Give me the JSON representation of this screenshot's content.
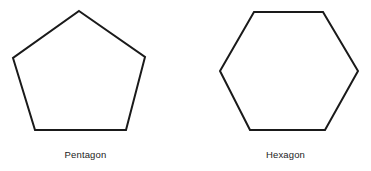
{
  "figure": {
    "background_color": "#ffffff",
    "stroke_color": "#1a1a1a",
    "fill_color": "#ffffff",
    "stroke_width": 2,
    "label_color": "#232323",
    "width": 371,
    "height": 171,
    "shapes": [
      {
        "name": "pentagon",
        "label": "Pentagon",
        "sides": 5,
        "points": "79,11 145,57 126,130 35,130 13,58",
        "label_center_x": 85,
        "label_top": 149
      },
      {
        "name": "hexagon",
        "label": "Hexagon",
        "sides": 6,
        "points": "254,12 323,12 358,71 325,130 250,130 220,71",
        "label_center_x": 285,
        "label_top": 149
      }
    ]
  }
}
